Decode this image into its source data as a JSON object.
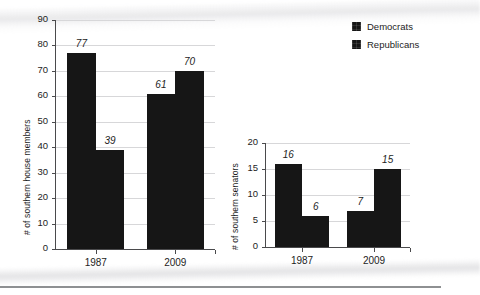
{
  "legend": {
    "position": "top-right",
    "entries": [
      {
        "label": "Democrats",
        "color": "#161616",
        "icon": "legend-swatch-democrats"
      },
      {
        "label": "Republicans",
        "color": "#161616",
        "icon": "legend-swatch-republicans"
      }
    ]
  },
  "chart_data": [
    {
      "id": "house",
      "type": "bar",
      "title": "",
      "xlabel": "",
      "ylabel": "# of southern house members",
      "categories": [
        "1987",
        "2009"
      ],
      "ylim": [
        0,
        90
      ],
      "yticks": [
        0,
        10,
        20,
        30,
        40,
        50,
        60,
        70,
        80,
        90
      ],
      "ytick_labels": [
        "0",
        "10",
        "20",
        "30",
        "40",
        "50",
        "60",
        "70",
        "80",
        "90"
      ],
      "grid": true,
      "legend_position": "top-right",
      "series": [
        {
          "name": "Democrats",
          "color": "#161616",
          "values": [
            77,
            61
          ],
          "labels": [
            "77",
            "61"
          ]
        },
        {
          "name": "Republicans",
          "color": "#161616",
          "values": [
            39,
            70
          ],
          "labels": [
            "39",
            "70"
          ]
        }
      ]
    },
    {
      "id": "senate",
      "type": "bar",
      "title": "",
      "xlabel": "",
      "ylabel": "# of southern senators",
      "categories": [
        "1987",
        "2009"
      ],
      "ylim": [
        0,
        20
      ],
      "yticks": [
        0,
        5,
        10,
        15,
        20
      ],
      "ytick_labels": [
        "0",
        "5",
        "10",
        "15",
        "20"
      ],
      "grid": true,
      "legend_position": "top-right",
      "series": [
        {
          "name": "Democrats",
          "color": "#161616",
          "values": [
            16,
            7
          ],
          "labels": [
            "16",
            "7"
          ]
        },
        {
          "name": "Republicans",
          "color": "#161616",
          "values": [
            6,
            15
          ],
          "labels": [
            "6",
            "15"
          ]
        }
      ]
    }
  ]
}
